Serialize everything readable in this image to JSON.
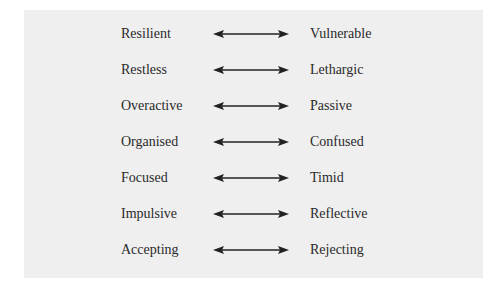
{
  "pairs": [
    {
      "left": "Resilient",
      "right": "Vulnerable"
    },
    {
      "left": "Restless",
      "right": "Lethargic"
    },
    {
      "left": "Overactive",
      "right": "Passive"
    },
    {
      "left": "Organised",
      "right": "Confused"
    },
    {
      "left": "Focused",
      "right": "Timid"
    },
    {
      "left": "Impulsive",
      "right": "Reflective"
    },
    {
      "left": "Accepting",
      "right": "Rejecting"
    }
  ],
  "arrow_icon": "double-headed-arrow-icon",
  "colors": {
    "panel_bg": "#efefef",
    "text": "#2a2a2a",
    "arrow": "#222222"
  }
}
